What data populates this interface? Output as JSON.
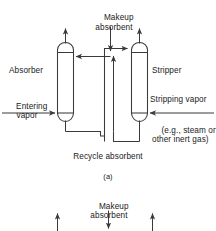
{
  "figure": {
    "caption_a": "(a)",
    "labels": {
      "makeup_absorbent": "Makeup\nabsorbent",
      "absorber": "Absorber",
      "stripper": "Stripper",
      "entering_vapor": "Entering\nvapor",
      "stripping_vapor": "Stripping vapor",
      "stripping_vapor_note": "(e.g., steam or\nother inert gas)",
      "recycle_absorbent": "Recycle absorbent"
    },
    "figure_b": {
      "makeup_absorbent": "Makeup\nabsorbent"
    },
    "colors": {
      "line": "#3a3a3a",
      "text": "#1a1a1a",
      "background": "#ffffff"
    },
    "equipment": [
      {
        "name": "absorber",
        "label": "Absorber",
        "type": "packed-column"
      },
      {
        "name": "stripper",
        "label": "Stripper",
        "type": "packed-column"
      }
    ],
    "streams": [
      {
        "name": "makeup-absorbent",
        "direction": "down",
        "label": "Makeup absorbent"
      },
      {
        "name": "entering-vapor",
        "direction": "right",
        "label": "Entering vapor"
      },
      {
        "name": "stripping-vapor",
        "direction": "left",
        "label": "Stripping vapor"
      },
      {
        "name": "recycle-absorbent",
        "direction": "loop",
        "label": "Recycle absorbent"
      },
      {
        "name": "absorber-overhead-vapor",
        "direction": "up",
        "label": ""
      },
      {
        "name": "stripper-overhead-vapor",
        "direction": "up",
        "label": ""
      }
    ]
  }
}
